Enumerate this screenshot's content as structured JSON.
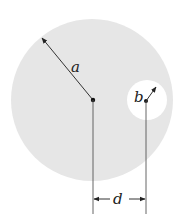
{
  "diagram": {
    "colors": {
      "disk_fill": "#e6e6e6",
      "hole_fill": "#ffffff",
      "line": "#333333",
      "dot": "#111111"
    },
    "large_circle": {
      "cx": 92,
      "cy": 100,
      "r": 81
    },
    "hole": {
      "cx": 147,
      "cy": 100,
      "r": 20
    },
    "labels": {
      "radius_a": "a",
      "radius_b": "b",
      "distance": "d"
    }
  }
}
